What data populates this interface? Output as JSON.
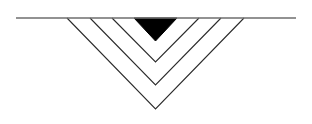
{
  "figure": {
    "title": "Nested chevron cross-section",
    "canvas": {
      "width": 312,
      "height": 124,
      "background_color": "#ffffff"
    },
    "colors": {
      "surface_line": "#6e6e6e",
      "chevron_stroke": "#2b2b2b",
      "filled_wedge": "#000000",
      "background": "#ffffff"
    },
    "surface_line": {
      "label": "surface line",
      "x1": 16,
      "y1": 18,
      "x2": 296,
      "y2": 18,
      "stroke_width": 1.4,
      "color": "#6e6e6e"
    },
    "apex_axis_x": 155.5,
    "shapes": [
      {
        "label": "filled wedge",
        "kind": "filled-triangle",
        "left_x": 134,
        "right_x": 177,
        "top_y": 18,
        "apex_y": 41,
        "fill": "#000000",
        "stroke": "#000000",
        "stroke_width": 1
      },
      {
        "label": "chevron 1",
        "kind": "outline-chevron",
        "left_x": 112,
        "right_x": 199,
        "top_y": 18,
        "apex_y": 62,
        "fill": "none",
        "stroke": "#2b2b2b",
        "stroke_width": 1.1
      },
      {
        "label": "chevron 2",
        "kind": "outline-chevron",
        "left_x": 90,
        "right_x": 221,
        "top_y": 18,
        "apex_y": 85,
        "fill": "none",
        "stroke": "#2b2b2b",
        "stroke_width": 1.1
      },
      {
        "label": "chevron 3",
        "kind": "outline-chevron",
        "left_x": 67,
        "right_x": 244,
        "top_y": 18,
        "apex_y": 109,
        "fill": "none",
        "stroke": "#2b2b2b",
        "stroke_width": 1.1
      }
    ],
    "chart_data": {
      "type": "line",
      "title": "Nested chevron cross-section",
      "xlabel": "",
      "ylabel": "",
      "xlim": [
        0,
        312
      ],
      "ylim": [
        124,
        0
      ],
      "grid": false,
      "legend": "none",
      "series": [
        {
          "name": "surface line",
          "x": [
            16,
            296
          ],
          "y": [
            18,
            18
          ]
        },
        {
          "name": "filled wedge",
          "x": [
            134,
            155.5,
            177
          ],
          "y": [
            18,
            41,
            18
          ]
        },
        {
          "name": "chevron 1",
          "x": [
            112,
            155.5,
            199
          ],
          "y": [
            18,
            62,
            18
          ]
        },
        {
          "name": "chevron 2",
          "x": [
            90,
            155.5,
            221
          ],
          "y": [
            18,
            85,
            18
          ]
        },
        {
          "name": "chevron 3",
          "x": [
            67,
            155.5,
            109
          ],
          "y": [
            18,
            109,
            18
          ]
        }
      ]
    }
  }
}
